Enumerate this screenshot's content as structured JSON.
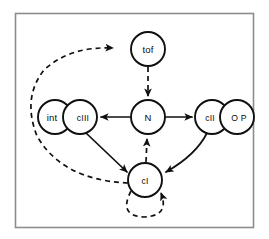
{
  "figure": {
    "background_color": "#ffffff",
    "frame_color": "#8d8d8d",
    "edge_color": "#101010",
    "node_fill": "#ffffff",
    "node_stroke": "#101010"
  },
  "diagram": {
    "type": "directed-graph",
    "nodes": [
      {
        "id": "tof",
        "label": "tof",
        "cx": 148,
        "cy": 49,
        "r": 17
      },
      {
        "id": "int",
        "label": "int",
        "cx": 55,
        "cy": 117,
        "r": 17
      },
      {
        "id": "cIII",
        "label": "cIII",
        "cx": 80,
        "cy": 117,
        "r": 17
      },
      {
        "id": "N",
        "label": "N",
        "cx": 148,
        "cy": 117,
        "r": 17
      },
      {
        "id": "cII",
        "label": "cII",
        "cx": 212,
        "cy": 117,
        "r": 17
      },
      {
        "id": "OP",
        "label": "O P",
        "cx": 237,
        "cy": 117,
        "r": 17
      },
      {
        "id": "cI",
        "label": "cI",
        "cx": 145,
        "cy": 180,
        "r": 17
      }
    ],
    "edges": [
      {
        "from": "tof",
        "to": "N",
        "style": "dashed",
        "shape": "straight"
      },
      {
        "from": "N",
        "to": "cIII",
        "style": "solid",
        "shape": "straight"
      },
      {
        "from": "N",
        "to": "cII",
        "style": "solid",
        "shape": "straight"
      },
      {
        "from": "cI",
        "to": "N",
        "style": "dashed",
        "shape": "straight"
      },
      {
        "from": "cIII",
        "to": "cI",
        "style": "solid",
        "shape": "straight"
      },
      {
        "from": "cII",
        "to": "cI",
        "style": "solid",
        "shape": "curve"
      },
      {
        "from": "cI",
        "to": "tof",
        "style": "dashed",
        "shape": "long-curve-left"
      },
      {
        "from": "cI",
        "to": "cI",
        "style": "dashed",
        "shape": "self-loop"
      }
    ]
  }
}
